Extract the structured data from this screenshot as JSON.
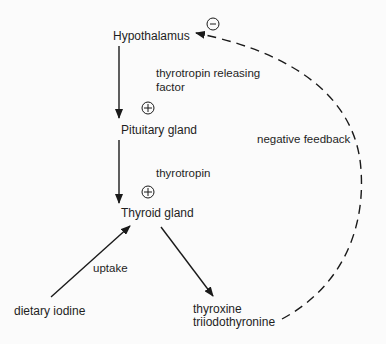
{
  "diagram": {
    "nodes": {
      "hypothalamus": "Hypothalamus",
      "pituitary": "Pituitary gland",
      "thyroid": "Thyroid gland",
      "dietary_iodine": "dietary iodine",
      "hormones_line1": "thyroxine",
      "hormones_line2": "triiodothyronine"
    },
    "edge_labels": {
      "trf_line1": "thyrotropin releasing",
      "trf_line2": "factor",
      "thyrotropin": "thyrotropin",
      "uptake": "uptake",
      "negative_feedback": "negative feedback"
    },
    "signs": {
      "plus": "+",
      "minus": "−"
    },
    "colors": {
      "line": "#1a1a1a",
      "background": "#fbfbfb"
    },
    "edges": [
      {
        "from": "Hypothalamus",
        "to": "Pituitary gland",
        "label": "thyrotropin releasing factor",
        "sign": "+",
        "style": "solid"
      },
      {
        "from": "Pituitary gland",
        "to": "Thyroid gland",
        "label": "thyrotropin",
        "sign": "+",
        "style": "solid"
      },
      {
        "from": "dietary iodine",
        "to": "Thyroid gland",
        "label": "uptake",
        "style": "solid"
      },
      {
        "from": "Thyroid gland",
        "to": "thyroxine triiodothyronine",
        "style": "solid"
      },
      {
        "from": "thyroxine triiodothyronine",
        "to": "Hypothalamus",
        "label": "negative feedback",
        "sign": "−",
        "style": "dashed"
      }
    ]
  }
}
